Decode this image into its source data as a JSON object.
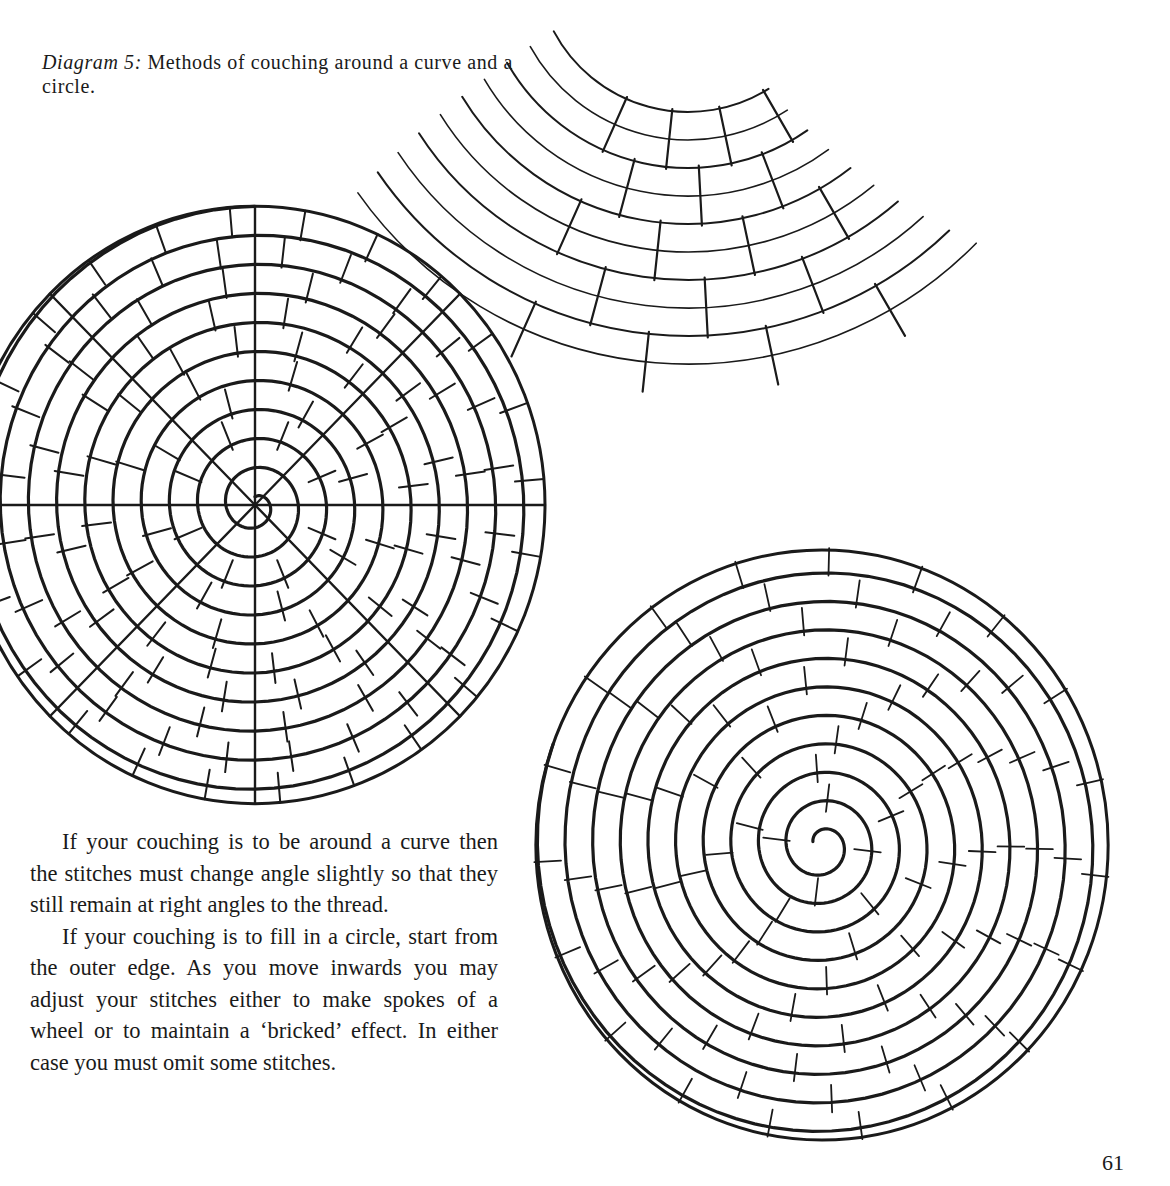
{
  "caption": {
    "label": "Diagram 5:",
    "text": " Methods of couching around a curve and a circle."
  },
  "body": {
    "paragraphs": [
      "If your couching is to be around a curve then the stitches must change angle slightly so that they still remain at right angles to the thread.",
      "If your couching is to fill in a circle, start from the outer edge. As you move inwards you may adjust your stitches either to make spokes of a wheel or to maintain a ‘bricked’ effect. In either case you must omit some stitches."
    ]
  },
  "page_number": "61",
  "figures": {
    "curve": {
      "description": "Couching around a curve: concentric arcs with stitches at right angles",
      "center": [
        688,
        -40
      ],
      "arcs": 10,
      "inner_radius": 152,
      "spacing": 28
    },
    "spoke_circle": {
      "description": "Circle filled with spokes-of-a-wheel couching",
      "center": [
        255,
        505
      ],
      "radius": 290,
      "spokes": 8,
      "turns": 10
    },
    "bricked_circle": {
      "description": "Circle filled with bricked couching",
      "center": [
        822,
        845
      ],
      "radius": 295,
      "turns": 10
    },
    "colors": {
      "ink": "#1a1a1a",
      "paper": "#ffffff"
    }
  }
}
